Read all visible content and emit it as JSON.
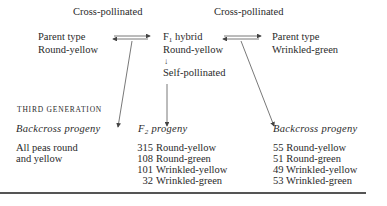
{
  "cross_labels": {
    "left": "Cross-pollinated",
    "right": "Cross-pollinated"
  },
  "parent_left": {
    "line1": "Parent type",
    "line2": "Round-yellow"
  },
  "f1": {
    "prefix": "F",
    "sub": "1",
    "suffix": " hybrid",
    "line2": "Round-yellow",
    "arrow": "↓",
    "line3": "Self-pollinated"
  },
  "parent_right": {
    "line1": "Parent type",
    "line2": "Wrinkled-green"
  },
  "generation_label": "THIRD GENERATION",
  "columns": {
    "left": {
      "heading": "Backcross progeny",
      "lines": [
        "All peas round",
        "and yellow"
      ]
    },
    "middle": {
      "heading_prefix": "F",
      "heading_sub": "2",
      "heading_suffix": " progeny",
      "rows": [
        {
          "count": "315",
          "label": "Round-yellow"
        },
        {
          "count": "108",
          "label": "Round-green"
        },
        {
          "count": "101",
          "label": "Wrinkled-yellow"
        },
        {
          "count": "32",
          "label": "Wrinkled-green"
        }
      ]
    },
    "right": {
      "heading": "Backcross progeny",
      "rows": [
        {
          "count": "55",
          "label": "Round-yellow"
        },
        {
          "count": "51",
          "label": "Round-green"
        },
        {
          "count": "49",
          "label": "Wrinkled-yellow"
        },
        {
          "count": "53",
          "label": "Wrinkled-green"
        }
      ]
    }
  },
  "colors": {
    "text": "#2a2a2a",
    "lines": "#555555",
    "background": "#ffffff"
  }
}
